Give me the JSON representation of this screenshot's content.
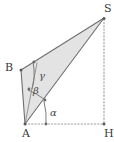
{
  "figure": {
    "type": "geometry-diagram",
    "width": 114,
    "height": 142,
    "background_color": "#ffffff",
    "fill_color": "#e2e2e2",
    "stroke_color": "#7a7a7a",
    "dotted_color": "#9a9a9a",
    "label_color": "#3a3a3a"
  },
  "vertices": [
    {
      "id": "S",
      "label": "S",
      "x": 104,
      "y": 18,
      "label_x": 104,
      "label_y": 4
    },
    {
      "id": "B",
      "label": "B",
      "x": 21,
      "y": 70,
      "label_x": 4,
      "label_y": 62
    },
    {
      "id": "A",
      "label": "A",
      "x": 25,
      "y": 124,
      "label_x": 22,
      "label_y": 128
    },
    {
      "id": "H",
      "label": "H",
      "x": 104,
      "y": 124,
      "label_x": 104,
      "label_y": 128
    }
  ],
  "angles": [
    {
      "id": "alpha",
      "label": "α",
      "at": "A",
      "label_x": 50,
      "label_y": 109
    },
    {
      "id": "beta",
      "label": "β",
      "at": "A",
      "label_x": 33,
      "label_y": 87
    },
    {
      "id": "gamma",
      "label": "γ",
      "at": "C",
      "label_x": 39,
      "label_y": 72
    }
  ],
  "segments": [
    {
      "id": "AB",
      "from": "A",
      "to": "B",
      "style": "solid"
    },
    {
      "id": "AS",
      "from": "A",
      "to": "S",
      "style": "solid"
    },
    {
      "id": "BS",
      "from": "B",
      "to": "S",
      "style": "solid"
    },
    {
      "id": "AH",
      "from": "A",
      "to": "H",
      "style": "dotted"
    },
    {
      "id": "SH",
      "from": "S",
      "to": "H",
      "style": "dotted"
    }
  ],
  "regions": [
    {
      "id": "polygon-ABS",
      "fill": "#e2e2e2",
      "points": "25,124 21,70 104,18"
    }
  ]
}
